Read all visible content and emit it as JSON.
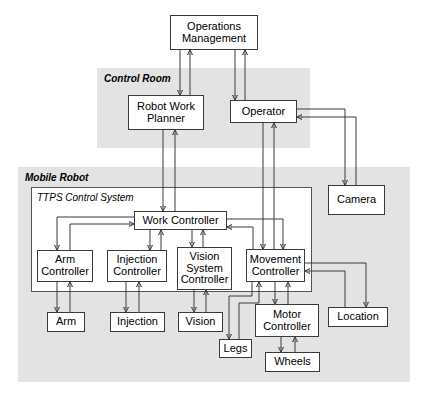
{
  "diagram": {
    "panels": [
      {
        "id": "control_room",
        "label": "Control Room",
        "x": 97,
        "y": 68,
        "w": 213,
        "h": 80,
        "fill": "#e3e3e3"
      },
      {
        "id": "mobile_robot",
        "label": "Mobile Robot",
        "x": 18,
        "y": 167,
        "w": 392,
        "h": 215,
        "fill": "#e3e3e3"
      }
    ],
    "subpanels": [
      {
        "id": "ttps",
        "label": "TTPS Control System",
        "x": 31,
        "y": 187,
        "w": 281,
        "h": 105
      }
    ],
    "nodes": [
      {
        "id": "operations_management",
        "label": "Operations\nManagement",
        "x": 170,
        "y": 15,
        "w": 88,
        "h": 35
      },
      {
        "id": "robot_work_planner",
        "label": "Robot Work\nPlanner",
        "x": 128,
        "y": 95,
        "w": 76,
        "h": 35
      },
      {
        "id": "operator",
        "label": "Operator",
        "x": 230,
        "y": 100,
        "w": 67,
        "h": 23
      },
      {
        "id": "camera",
        "label": "Camera",
        "x": 328,
        "y": 185,
        "w": 57,
        "h": 30
      },
      {
        "id": "work_controller",
        "label": "Work Controller",
        "x": 134,
        "y": 211,
        "w": 93,
        "h": 19
      },
      {
        "id": "arm_controller",
        "label": "Arm\nController",
        "x": 37,
        "y": 250,
        "w": 56,
        "h": 32
      },
      {
        "id": "injection_controller",
        "label": "Injection\nController",
        "x": 107,
        "y": 250,
        "w": 60,
        "h": 32
      },
      {
        "id": "vision_system_controller",
        "label": "Vision\nSystem\nController",
        "x": 177,
        "y": 247,
        "w": 55,
        "h": 43
      },
      {
        "id": "movement_controller",
        "label": "Movement\nController",
        "x": 246,
        "y": 249,
        "w": 59,
        "h": 33
      },
      {
        "id": "arm",
        "label": "Arm",
        "x": 47,
        "y": 312,
        "w": 38,
        "h": 20
      },
      {
        "id": "injection",
        "label": "Injection",
        "x": 110,
        "y": 312,
        "w": 55,
        "h": 20
      },
      {
        "id": "vision",
        "label": "Vision",
        "x": 178,
        "y": 312,
        "w": 45,
        "h": 20
      },
      {
        "id": "legs",
        "label": "Legs",
        "x": 219,
        "y": 339,
        "w": 33,
        "h": 19
      },
      {
        "id": "motor_controller",
        "label": "Motor\nController",
        "x": 255,
        "y": 304,
        "w": 64,
        "h": 33
      },
      {
        "id": "wheels",
        "label": "Wheels",
        "x": 265,
        "y": 352,
        "w": 55,
        "h": 20
      },
      {
        "id": "location",
        "label": "Location",
        "x": 328,
        "y": 307,
        "w": 60,
        "h": 20
      }
    ],
    "edges": [
      {
        "from": "operations_management",
        "to": "robot_work_planner",
        "label": ""
      },
      {
        "from": "robot_work_planner",
        "to": "operations_management",
        "label": ""
      },
      {
        "from": "operations_management",
        "to": "operator",
        "label": ""
      },
      {
        "from": "operator",
        "to": "operations_management",
        "label": ""
      },
      {
        "from": "robot_work_planner",
        "to": "work_controller",
        "label": ""
      },
      {
        "from": "work_controller",
        "to": "robot_work_planner",
        "label": ""
      },
      {
        "from": "operator",
        "to": "movement_controller",
        "label": ""
      },
      {
        "from": "movement_controller",
        "to": "operator",
        "label": ""
      },
      {
        "from": "camera",
        "to": "operator",
        "label": ""
      },
      {
        "from": "operator",
        "to": "camera",
        "label": ""
      },
      {
        "from": "work_controller",
        "to": "arm_controller",
        "label": ""
      },
      {
        "from": "arm_controller",
        "to": "work_controller",
        "label": ""
      },
      {
        "from": "work_controller",
        "to": "injection_controller",
        "label": ""
      },
      {
        "from": "injection_controller",
        "to": "work_controller",
        "label": ""
      },
      {
        "from": "work_controller",
        "to": "vision_system_controller",
        "label": ""
      },
      {
        "from": "vision_system_controller",
        "to": "work_controller",
        "label": ""
      },
      {
        "from": "work_controller",
        "to": "movement_controller",
        "label": ""
      },
      {
        "from": "movement_controller",
        "to": "work_controller",
        "label": ""
      },
      {
        "from": "arm_controller",
        "to": "arm",
        "label": ""
      },
      {
        "from": "arm",
        "to": "arm_controller",
        "label": ""
      },
      {
        "from": "injection_controller",
        "to": "injection",
        "label": ""
      },
      {
        "from": "injection",
        "to": "injection_controller",
        "label": ""
      },
      {
        "from": "vision_system_controller",
        "to": "vision",
        "label": ""
      },
      {
        "from": "vision",
        "to": "vision_system_controller",
        "label": ""
      },
      {
        "from": "movement_controller",
        "to": "legs",
        "label": ""
      },
      {
        "from": "legs",
        "to": "movement_controller",
        "label": ""
      },
      {
        "from": "movement_controller",
        "to": "motor_controller",
        "label": ""
      },
      {
        "from": "motor_controller",
        "to": "movement_controller",
        "label": ""
      },
      {
        "from": "motor_controller",
        "to": "wheels",
        "label": ""
      },
      {
        "from": "wheels",
        "to": "motor_controller",
        "label": ""
      },
      {
        "from": "location",
        "to": "movement_controller",
        "label": ""
      },
      {
        "from": "movement_controller",
        "to": "location",
        "label": ""
      }
    ],
    "colors": {
      "panel_fill": "#e3e3e3",
      "node_fill": "#ffffff",
      "stroke": "#3a3a3a",
      "background": "#ffffff"
    }
  }
}
